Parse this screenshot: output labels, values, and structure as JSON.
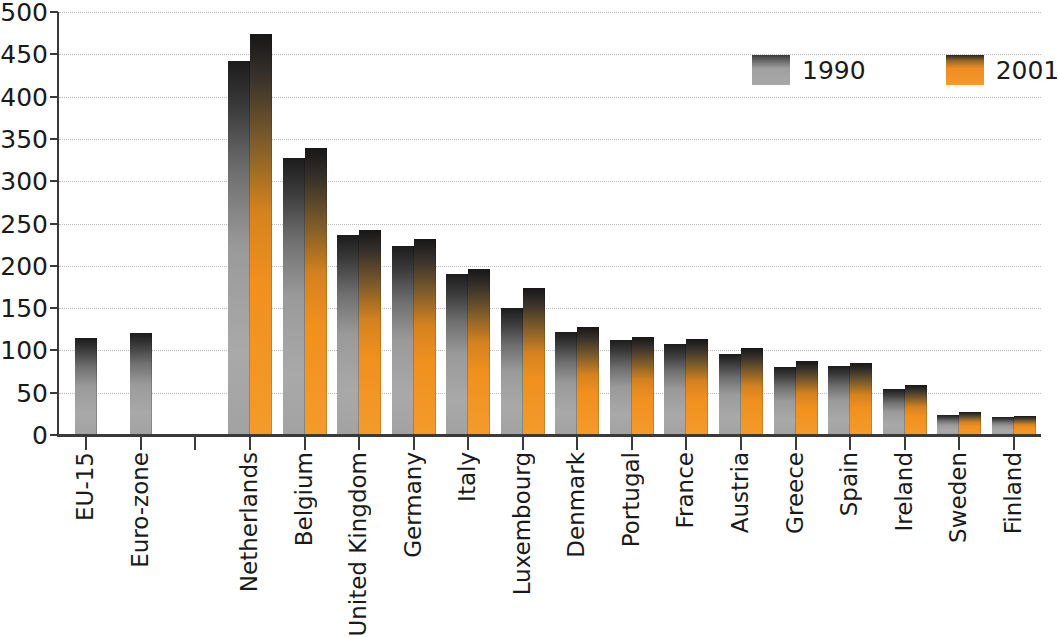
{
  "chart_data": {
    "type": "bar",
    "title": "",
    "subtitle": "",
    "xlabel": "",
    "ylabel": "",
    "ylim": [
      0,
      500
    ],
    "yticks": [
      0,
      50,
      100,
      150,
      200,
      250,
      300,
      350,
      400,
      450,
      500
    ],
    "ytick_labels": [
      "0",
      "50",
      "100",
      "150",
      "200",
      "250",
      "300",
      "350",
      "400",
      "450",
      "500"
    ],
    "grid": true,
    "legend_position": "top-right",
    "categories": [
      "EU-15",
      "Euro-zone",
      "",
      "Netherlands",
      "Belgium",
      "United Kingdom",
      "Germany",
      "Italy",
      "Luxembourg",
      "Denmark",
      "Portugal",
      "France",
      "Austria",
      "Greece",
      "Spain",
      "Ireland",
      "Sweden",
      "Finland"
    ],
    "series": [
      {
        "name": "1990",
        "color": "#9a9a9a",
        "values": [
          115,
          120,
          null,
          442,
          328,
          237,
          223,
          190,
          150,
          122,
          112,
          108,
          96,
          80,
          81,
          54,
          24,
          21
        ]
      },
      {
        "name": "2001",
        "color": "#ef8c23",
        "values": [
          null,
          null,
          null,
          474,
          339,
          242,
          232,
          196,
          174,
          128,
          116,
          113,
          103,
          87,
          85,
          59,
          27,
          22
        ]
      }
    ],
    "annotations": []
  },
  "legend": {
    "entries": [
      {
        "label": "1990",
        "color": "#9a9a9a"
      },
      {
        "label": "2001",
        "color": "#ef8c23"
      }
    ]
  },
  "axis": {
    "y_max_label": "500",
    "y_min_label": "0"
  }
}
